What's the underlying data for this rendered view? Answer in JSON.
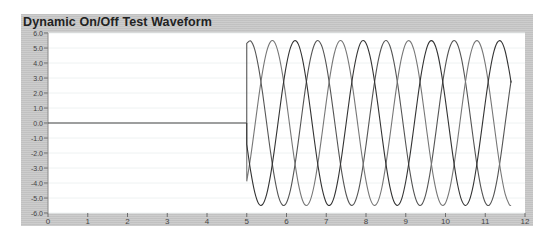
{
  "window": {
    "title": "Dynamic On/Off Test Waveform"
  },
  "colors": {
    "frame": "#c9c9c9",
    "plot_bg": "#ffffff",
    "phase_a": "#555555",
    "phase_b": "#777777",
    "phase_c": "#333333",
    "baseline": "#444444"
  },
  "chart_data": {
    "type": "line",
    "title": "Dynamic On/Off Test Waveform",
    "xlabel": "",
    "ylabel": "",
    "xlim": [
      0,
      12
    ],
    "ylim": [
      -6.0,
      6.0
    ],
    "x_ticks": [
      "0",
      "1",
      "2",
      "3",
      "4",
      "5",
      "6",
      "7",
      "8",
      "9",
      "10",
      "11",
      "12"
    ],
    "y_ticks": [
      "6.0",
      "5.0",
      "4.0",
      "3.0",
      "2.0",
      "1.0",
      "0.0",
      "-1.0",
      "-2.0",
      "-3.0",
      "-4.0",
      "-5.0",
      "-6.0"
    ],
    "grid": true,
    "legend": null,
    "annotations": [],
    "pre_onset": {
      "x": [
        0,
        5.0
      ],
      "value": 0.0
    },
    "x": [
      5.0,
      5.1,
      5.2,
      5.3,
      5.4,
      5.5,
      5.6,
      5.7,
      5.8,
      5.9,
      6.0,
      6.1,
      6.2,
      6.3,
      6.4,
      6.5,
      6.6,
      6.7,
      6.8,
      6.9,
      7.0,
      7.1,
      7.2,
      7.3,
      7.4,
      7.5,
      7.6,
      7.7,
      7.8,
      7.9,
      8.0,
      8.1,
      8.2,
      8.3,
      8.4,
      8.5,
      8.6,
      8.7,
      8.8,
      8.9,
      9.0,
      9.1,
      9.2,
      9.3,
      9.4,
      9.5,
      9.6,
      9.7,
      9.8,
      9.9,
      10.0,
      10.1,
      10.2,
      10.3,
      10.4,
      10.5,
      10.6,
      10.7,
      10.8,
      10.9,
      11.0,
      11.1,
      11.2,
      11.3,
      11.4,
      11.5,
      11.6,
      11.65
    ],
    "series": [
      {
        "name": "Phase A",
        "values": [
          5.31,
          5.47,
          4.91,
          3.67,
          1.97,
          0.0,
          -1.96,
          -3.66,
          -4.91,
          -5.47,
          -5.31,
          -4.46,
          -3.01,
          -1.18,
          0.83,
          2.74,
          4.26,
          5.22,
          5.49,
          5.04,
          3.91,
          2.26,
          0.32,
          -1.67,
          -3.44,
          -4.75,
          -5.43,
          -5.38,
          -4.63,
          -3.27,
          -1.47,
          0.53,
          2.46,
          4.06,
          5.12,
          5.5,
          5.15,
          4.11,
          2.54,
          0.62,
          -1.38,
          -3.18,
          -4.58,
          -5.37,
          -5.44,
          -4.79,
          -3.51,
          -1.76,
          0.23,
          2.19,
          3.86,
          5.0,
          5.49,
          5.25,
          4.32,
          2.8,
          0.92,
          -1.08,
          -2.94,
          -4.41,
          -5.3,
          -5.48,
          -4.93,
          -3.74,
          -2.04,
          -0.07,
          1.9,
          2.82
        ]
      },
      {
        "name": "Phase B",
        "values": [
          -3.89,
          -2.24,
          -0.29,
          1.7,
          3.46,
          4.76,
          5.43,
          5.38,
          4.61,
          3.24,
          1.44,
          -0.56,
          -2.48,
          -4.08,
          -5.13,
          -5.5,
          -5.14,
          -4.1,
          -2.51,
          -0.6,
          1.39,
          3.21,
          4.6,
          5.37,
          5.44,
          4.78,
          3.49,
          1.73,
          -0.25,
          -2.21,
          -3.86,
          -5.01,
          -5.49,
          -5.24,
          -4.3,
          -2.78,
          -0.91,
          1.1,
          2.96,
          4.42,
          5.3,
          5.47,
          4.92,
          3.72,
          2.02,
          0.05,
          -1.92,
          -3.64,
          -4.87,
          -5.46,
          -5.33,
          -4.48,
          -3.04,
          -1.22,
          0.79,
          2.71,
          4.24,
          5.21,
          5.49,
          5.05,
          3.94,
          2.29,
          0.36,
          -1.63,
          -3.4,
          -4.73,
          -5.42,
          -5.5
        ]
      },
      {
        "name": "Phase C",
        "values": [
          -1.42,
          -3.23,
          -4.61,
          -5.38,
          -5.43,
          -4.76,
          -3.46,
          -1.7,
          0.28,
          2.24,
          3.89,
          5.02,
          5.49,
          5.24,
          4.29,
          2.77,
          0.89,
          -1.12,
          -2.98,
          -4.43,
          -5.31,
          -5.47,
          -4.92,
          -3.71,
          -2.0,
          -0.03,
          1.94,
          3.65,
          4.88,
          5.47,
          5.32,
          4.47,
          3.03,
          1.19,
          -0.82,
          -2.71,
          -4.24,
          -5.22,
          -5.49,
          -5.04,
          -3.9,
          -2.28,
          -0.35,
          1.65,
          3.42,
          4.73,
          5.42,
          5.39,
          4.65,
          3.28,
          1.48,
          -0.51,
          -2.44,
          -4.05,
          -5.11,
          -5.5,
          -5.16,
          -4.14,
          -2.55,
          -0.64,
          1.35,
          3.17,
          4.58,
          5.36,
          5.44,
          4.8,
          3.51,
          2.69
        ]
      }
    ]
  }
}
